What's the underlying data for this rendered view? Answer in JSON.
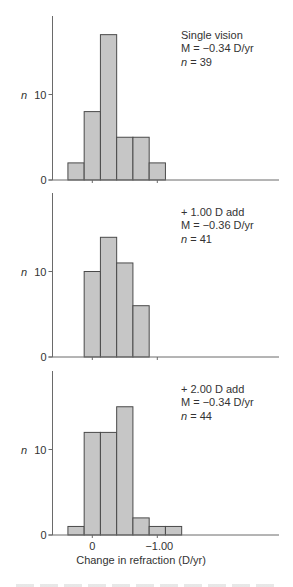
{
  "chart_data": [
    {
      "type": "bar",
      "title": "",
      "xlabel": "",
      "ylabel": "n",
      "ylim": [
        0,
        19
      ],
      "y_ticks": [
        "0",
        "10"
      ],
      "x_ticks": [
        "0",
        "−1.00"
      ],
      "bin_width": 0.25,
      "bin_centers": [
        0.25,
        0,
        -0.25,
        -0.5,
        -0.75,
        -1.0
      ],
      "values": [
        2,
        8,
        17,
        5,
        5,
        2
      ],
      "annotation": [
        "Single vision",
        "M = −0.34 D/yr",
        "n = 39"
      ],
      "annotation_parts": {
        "group": "Single vision",
        "mean": "M = −0.34 D/yr",
        "n_symbol": "n",
        "n_value": " = 39"
      },
      "grid": false
    },
    {
      "type": "bar",
      "title": "",
      "xlabel": "",
      "ylabel": "n",
      "ylim": [
        0,
        19
      ],
      "y_ticks": [
        "0",
        "10"
      ],
      "x_ticks": [
        "0",
        "−1.00"
      ],
      "bin_width": 0.25,
      "bin_centers": [
        0,
        -0.25,
        -0.5,
        -0.75
      ],
      "values": [
        10,
        14,
        11,
        6
      ],
      "annotation": [
        "+ 1.00 D add",
        "M = −0.36 D/yr",
        "n = 41"
      ],
      "annotation_parts": {
        "group": "+ 1.00 D add",
        "mean": "M = −0.36 D/yr",
        "n_symbol": "n",
        "n_value": " = 41"
      },
      "grid": false
    },
    {
      "type": "bar",
      "title": "",
      "xlabel": "Change in refraction (D/yr)",
      "ylabel": "n",
      "ylim": [
        0,
        19
      ],
      "y_ticks": [
        "0",
        "10"
      ],
      "x_ticks": [
        "0",
        "−1.00"
      ],
      "x_tick_labels_visible": true,
      "bin_width": 0.25,
      "bin_centers": [
        0.25,
        0,
        -0.25,
        -0.5,
        -0.75,
        -1.0,
        -1.25
      ],
      "values": [
        1,
        12,
        12,
        15,
        2,
        1,
        1
      ],
      "annotation": [
        "+ 2.00 D add",
        "M = −0.34 D/yr",
        "n = 44"
      ],
      "annotation_parts": {
        "group": "+ 2.00 D add",
        "mean": "M = −0.34 D/yr",
        "n_symbol": "n",
        "n_value": " = 44"
      },
      "grid": false
    }
  ]
}
